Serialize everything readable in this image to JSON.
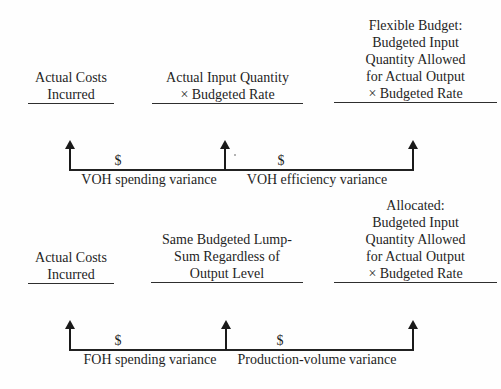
{
  "voh": {
    "columns": [
      {
        "lines": [
          "Actual Costs",
          "Incurred"
        ]
      },
      {
        "lines": [
          "Actual Input Quantity",
          "× Budgeted Rate"
        ]
      },
      {
        "lines": [
          "Flexible Budget:",
          "Budgeted Input",
          "Quantity Allowed",
          "for Actual Output",
          "× Budgeted Rate"
        ]
      }
    ],
    "bracket": {
      "left_dollar": "$",
      "right_dollar": "$",
      "left_label": "VOH spending variance",
      "right_label": "VOH efficiency variance"
    }
  },
  "foh": {
    "columns": [
      {
        "lines": [
          "Actual Costs",
          "Incurred"
        ]
      },
      {
        "lines": [
          "Same Budgeted Lump-",
          "Sum Regardless of",
          "Output Level"
        ]
      },
      {
        "lines": [
          "Allocated:",
          "Budgeted Input",
          "Quantity Allowed",
          "for Actual Output",
          "× Budgeted Rate"
        ]
      }
    ],
    "bracket": {
      "left_dollar": "$",
      "right_dollar": "$",
      "left_label": "FOH spending variance",
      "right_label": "Production-volume variance"
    }
  },
  "colors": {
    "ink": "#1f1f1f",
    "line": "#222222",
    "background": "#fefefe"
  }
}
